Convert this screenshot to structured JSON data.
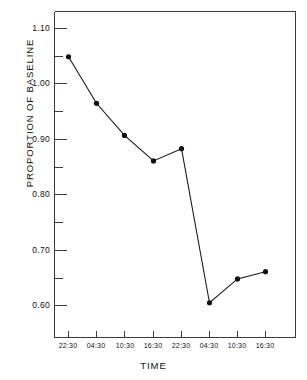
{
  "chart_data": {
    "type": "line",
    "title": "",
    "xlabel": "TIME",
    "ylabel": "PROPORTION OF BASELINE",
    "x_tick_labels": [
      "22:30",
      "04:30",
      "10:30",
      "16:30",
      "22:30",
      "04:30",
      "10:30",
      "16:30"
    ],
    "y_tick_labels": [
      "1.10",
      "1.00",
      "0.90",
      "0.80",
      "0.70",
      "0.60"
    ],
    "y_major_ticks": [
      1.1,
      1.0,
      0.9,
      0.8,
      0.7,
      0.6
    ],
    "y_minor_ticks": [
      1.05,
      0.95,
      0.85,
      0.75,
      0.65
    ],
    "ylim": [
      0.555,
      1.135
    ],
    "xlim": [
      0,
      9
    ],
    "grid": false,
    "legend": null,
    "marker": "filled-circle",
    "line_color": "#1a1a1a",
    "marker_color": "#111111",
    "categories": [
      "22:30",
      "04:30",
      "10:30",
      "16:30",
      "22:30",
      "04:30",
      "10:30",
      "16:30"
    ],
    "values": [
      1.049,
      0.965,
      0.907,
      0.861,
      0.883,
      0.605,
      0.648,
      0.661
    ],
    "series": [
      {
        "name": "proportion of baseline",
        "points": [
          {
            "x": "22:30",
            "y": 1.049
          },
          {
            "x": "04:30",
            "y": 0.965
          },
          {
            "x": "10:30",
            "y": 0.907
          },
          {
            "x": "16:30",
            "y": 0.861
          },
          {
            "x": "22:30",
            "y": 0.883
          },
          {
            "x": "04:30",
            "y": 0.605
          },
          {
            "x": "10:30",
            "y": 0.648
          },
          {
            "x": "16:30",
            "y": 0.661
          }
        ]
      }
    ]
  },
  "axes": {
    "y_title": "PROPORTION OF BASELINE",
    "x_title": "TIME",
    "y_labels": [
      "1.10",
      "1.00",
      "0.90",
      "0.80",
      "0.70",
      "0.60"
    ],
    "x_labels": [
      "22:30",
      "04:30",
      "10:30",
      "16:30",
      "22:30",
      "04:30",
      "10:30",
      "16:30"
    ]
  },
  "colors": {
    "axis": "#3c3c3c",
    "line": "#1a1a1a",
    "marker": "#111111",
    "background": "#ffffff",
    "text": "#111111"
  }
}
